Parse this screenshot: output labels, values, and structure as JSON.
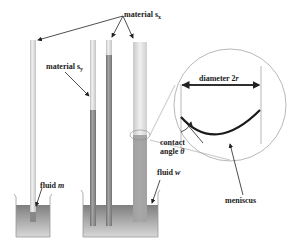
{
  "labels": {
    "material_sx": {
      "text": "material s",
      "sub": "x"
    },
    "material_sy": {
      "text": "material s",
      "sub": "y"
    },
    "diameter": {
      "text": "diameter 2",
      "var": "r"
    },
    "contact_angle": {
      "line1": "contact",
      "line2": "angle ",
      "var": "θ"
    },
    "meniscus": "meniscus",
    "fluid_m": {
      "text": "fluid ",
      "var": "m"
    },
    "fluid_w": {
      "text": "fluid ",
      "var": "w"
    }
  },
  "colors": {
    "tube_light": "#e8e8e8",
    "tube_shade": "#b8b8b8",
    "fluid": "#8a8a8a",
    "fluid_light": "#c8c8c8",
    "meniscus": "#1a1a1a",
    "line": "#333333"
  }
}
